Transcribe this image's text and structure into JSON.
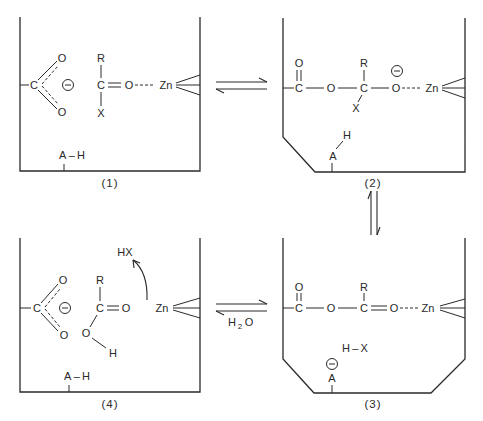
{
  "diagram": {
    "title": "",
    "panels": [
      {
        "id": "1",
        "label": "(1)",
        "atoms": {
          "carboxylate_c": "C",
          "carboxylate_o_top": "O",
          "carboxylate_o_bottom": "O",
          "substrate_r": "R",
          "substrate_c": "C",
          "substrate_x": "X",
          "substrate_o": "O",
          "zinc": "Zn",
          "acid_group": "A – H"
        }
      },
      {
        "id": "2",
        "label": "(2)",
        "atoms": {
          "ester_o_top": "O",
          "ester_c": "C",
          "ester_o": "O",
          "tetrahedral_r": "R",
          "tetrahedral_c": "C",
          "tetrahedral_x": "X",
          "alkoxide_o": "O",
          "zinc": "Zn",
          "acid_a": "A",
          "acid_h": "H"
        }
      },
      {
        "id": "3",
        "label": "(3)",
        "atoms": {
          "ester_o_top": "O",
          "ester_c": "C",
          "ester_o": "O",
          "acyl_r": "R",
          "acyl_c": "C",
          "acyl_o": "O",
          "zinc": "Zn",
          "leaving_group": "H – X",
          "base_a": "A"
        }
      },
      {
        "id": "4",
        "label": "(4)",
        "atoms": {
          "carboxylate_c": "C",
          "carboxylate_o_top": "O",
          "carboxylate_o_bottom": "O",
          "acid_r": "R",
          "acid_c": "C",
          "acid_o_double": "O",
          "acid_o_h": "O",
          "acid_h": "H",
          "released": "HX",
          "zinc": "Zn",
          "acid_group": "A – H"
        }
      }
    ],
    "equilibria": [
      {
        "from": "1",
        "to": "2",
        "type": "reversible"
      },
      {
        "from": "2",
        "to": "3",
        "type": "reversible"
      },
      {
        "from": "3",
        "to": "4",
        "type": "reversible",
        "reagent": "H",
        "reagent_sub": "2",
        "reagent_tail": "O"
      }
    ],
    "charge_symbol": "−"
  }
}
